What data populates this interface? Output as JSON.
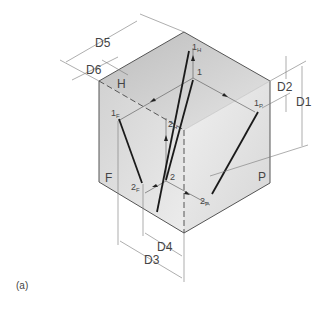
{
  "figure": {
    "caption": "(a)",
    "faces": {
      "top": "H",
      "front": "F",
      "profile": "P"
    },
    "points": {
      "p1H": {
        "main": "1",
        "sub": "H"
      },
      "p1": {
        "main": "1",
        "sub": ""
      },
      "p2H": {
        "main": "2",
        "sub": "H"
      },
      "p1F": {
        "main": "1",
        "sub": "F"
      },
      "p1P": {
        "main": "1",
        "sub": "P"
      },
      "p2": {
        "main": "2",
        "sub": ""
      },
      "p2F": {
        "main": "2",
        "sub": "F"
      },
      "p2P": {
        "main": "2",
        "sub": "P"
      }
    },
    "dimensions": {
      "d1": "D1",
      "d2": "D2",
      "d3": "D3",
      "d4": "D4",
      "d5": "D5",
      "d6": "D6"
    },
    "colors": {
      "top_face": "#c8c8c8",
      "front_face": "#dedede",
      "side_face": "#e6e6e6",
      "edge": "#555555",
      "line": "#1a1a1a"
    }
  }
}
